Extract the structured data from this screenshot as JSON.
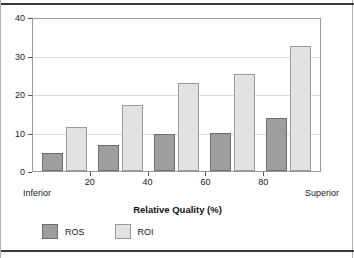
{
  "chart_data": {
    "type": "bar",
    "title": "",
    "xlabel": "Relative Quality (%)",
    "ylabel": "",
    "categories": [
      "10",
      "30",
      "50",
      "70",
      "90"
    ],
    "series": [
      {
        "name": "ROS",
        "color": "#9e9e9e",
        "values": [
          4.8,
          6.7,
          9.5,
          10.0,
          13.8
        ]
      },
      {
        "name": "ROI",
        "color": "#e2e2e2",
        "values": [
          11.4,
          17.2,
          22.9,
          25.2,
          32.5
        ]
      }
    ],
    "ylim": [
      0,
      40
    ],
    "yticks": [
      0,
      10,
      20,
      30,
      40
    ],
    "ytick_labels": [
      "0",
      "10",
      "20",
      "30",
      "40"
    ],
    "xlim": [
      0,
      100
    ],
    "xticks": [
      20,
      40,
      60,
      80
    ],
    "xtick_labels": [
      "20",
      "40",
      "60",
      "80"
    ],
    "axis_end_labels": {
      "left": "Inferior",
      "right": "Superior"
    },
    "grid": "horizontal",
    "legend_position": "bottom-left",
    "legend": [
      "ROS",
      "ROI"
    ]
  }
}
